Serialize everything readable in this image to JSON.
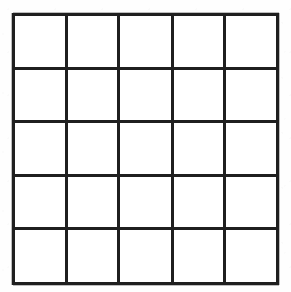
{
  "figure": {
    "type": "grid",
    "title": "",
    "rows": 5,
    "columns": 5,
    "cell_count": 25,
    "cells_filled": 0,
    "cell_contents": [
      [
        "",
        "",
        "",
        "",
        ""
      ],
      [
        "",
        "",
        "",
        "",
        ""
      ],
      [
        "",
        "",
        "",
        "",
        ""
      ],
      [
        "",
        "",
        "",
        "",
        ""
      ],
      [
        "",
        "",
        "",
        "",
        ""
      ]
    ]
  },
  "geometry": {
    "image_width": 291,
    "image_height": 292,
    "grid_left": 14,
    "grid_top": 14,
    "grid_width": 264,
    "grid_height": 270,
    "column_pitch": 52.6,
    "row_pitch": 53.8,
    "line_width": 3,
    "column_line_x": [
      14,
      66.6,
      119.2,
      171.8,
      224.4,
      277
    ],
    "row_line_y": [
      14,
      67.8,
      121.6,
      175.4,
      229.2,
      283
    ]
  },
  "colors": {
    "line": "#1f1f1f",
    "line_soft": "#282828",
    "cell_background": "#ffffff",
    "page_background": "#ffffff"
  }
}
